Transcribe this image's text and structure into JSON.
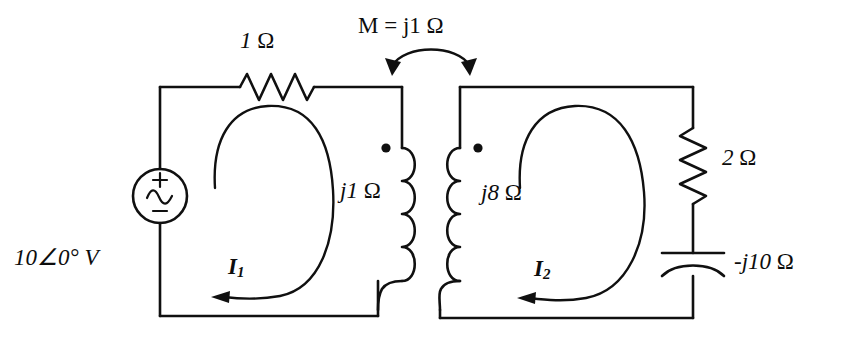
{
  "figure": {
    "type": "circuit-schematic",
    "background_color": "#ffffff",
    "line_color": "#101010"
  },
  "source": {
    "name": "ac-voltage-source",
    "label": "10∠0° V",
    "plus_sign": "+",
    "minus_sign": "−",
    "waveform_symbol": "~"
  },
  "components": {
    "resistor_left": {
      "name": "resistor-1-ohm",
      "label": "1 Ω",
      "value": "1",
      "unit": "Ω"
    },
    "resistor_right": {
      "name": "resistor-2-ohm",
      "label": "2 Ω",
      "value": "2",
      "unit": "Ω"
    },
    "capacitor": {
      "name": "capacitor-neg-j10-ohm",
      "label": "–j10 Ω",
      "value": "-j10",
      "unit": "Ω"
    },
    "inductor_left": {
      "name": "inductor-j1-ohm",
      "label": "j1 Ω",
      "value": "j1",
      "unit": "Ω"
    },
    "inductor_right": {
      "name": "inductor-j8-ohm",
      "label": "j8 Ω",
      "value": "j8",
      "unit": "Ω"
    },
    "mutual": {
      "name": "mutual-inductance",
      "label": "M = j1 Ω",
      "value": "j1",
      "unit": "Ω"
    }
  },
  "mesh_currents": [
    {
      "name": "mesh-current-1",
      "symbol": "I",
      "subscript": "1",
      "direction": "counter-clockwise"
    },
    {
      "name": "mesh-current-2",
      "symbol": "I",
      "subscript": "2",
      "direction": "counter-clockwise"
    }
  ],
  "dots": [
    {
      "name": "polarity-dot-left",
      "position": "top of left coil"
    },
    {
      "name": "polarity-dot-right",
      "position": "top of right coil"
    }
  ]
}
